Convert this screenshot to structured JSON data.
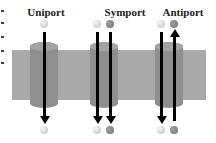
{
  "labels": {
    "uniport": "Uniport",
    "symport": "Symport",
    "antiport": "Antiport"
  },
  "diagram": {
    "nodes": [
      {
        "id": "uniport",
        "label": "Uniport",
        "molecules": [
          "light"
        ],
        "directions": [
          "in"
        ]
      },
      {
        "id": "symport",
        "label": "Symport",
        "molecules": [
          "light",
          "dark"
        ],
        "directions": [
          "in",
          "in"
        ]
      },
      {
        "id": "antiport",
        "label": "Antiport",
        "molecules": [
          "light",
          "dark"
        ],
        "directions": [
          "in",
          "out"
        ]
      }
    ]
  },
  "colors": {
    "membrane": "#a9a9a9",
    "channel": "#8f8f8f",
    "arrow": "#000000"
  }
}
